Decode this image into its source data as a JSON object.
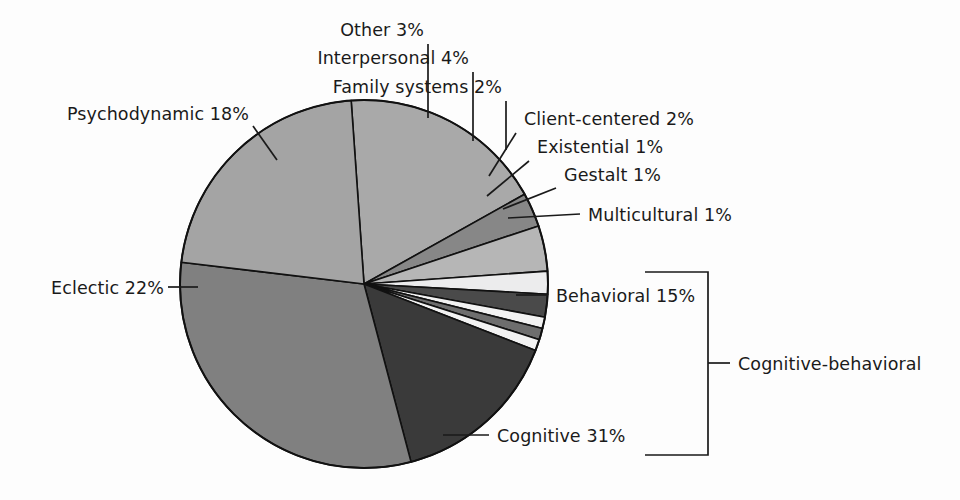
{
  "chart_data": {
    "type": "pie",
    "title": "",
    "subtitle": "",
    "xlabel": "",
    "ylabel": "",
    "legend_position": "callout-labels",
    "grid": false,
    "units": "percent",
    "total": 100,
    "start_angle_deg": -94,
    "direction": "clockwise",
    "categories": [
      "Psychodynamic",
      "Other",
      "Interpersonal",
      "Family systems",
      "Client-centered",
      "Existential",
      "Gestalt",
      "Multicultural",
      "Behavioral",
      "Cognitive",
      "Eclectic"
    ],
    "values": [
      18,
      3,
      4,
      2,
      2,
      1,
      1,
      1,
      15,
      31,
      22
    ],
    "colors": [
      "#a9a9a9",
      "#878787",
      "#b6b6b6",
      "#ececed",
      "#4a4a4a",
      "#f2f2f2",
      "#6e6e6e",
      "#f2f2f2",
      "#3a3a3a",
      "#808080",
      "#a4a4a4"
    ],
    "slices": [
      {
        "label": "Psychodynamic",
        "value": 18,
        "display": "Psychodynamic 18%",
        "color": "#a9a9a9"
      },
      {
        "label": "Other",
        "value": 3,
        "display": "Other 3%",
        "color": "#878787"
      },
      {
        "label": "Interpersonal",
        "value": 4,
        "display": "Interpersonal 4%",
        "color": "#b6b6b6"
      },
      {
        "label": "Family systems",
        "value": 2,
        "display": "Family systems  2%",
        "color": "#ececed"
      },
      {
        "label": "Client-centered",
        "value": 2,
        "display": "Client-centered 2%",
        "color": "#4a4a4a"
      },
      {
        "label": "Existential",
        "value": 1,
        "display": "Existential 1%",
        "color": "#f2f2f2"
      },
      {
        "label": "Gestalt",
        "value": 1,
        "display": "Gestalt 1%",
        "color": "#6e6e6e"
      },
      {
        "label": "Multicultural",
        "value": 1,
        "display": "Multicultural 1%",
        "color": "#f2f2f2"
      },
      {
        "label": "Behavioral",
        "value": 15,
        "display": "Behavioral 15%",
        "color": "#3a3a3a"
      },
      {
        "label": "Cognitive",
        "value": 31,
        "display": "Cognitive 31%",
        "color": "#808080"
      },
      {
        "label": "Eclectic",
        "value": 22,
        "display": "Eclectic 22%",
        "color": "#a4a4a4"
      }
    ],
    "annotations": [
      {
        "text": "Cognitive-behavioral",
        "type": "bracket-group",
        "groups": [
          "Behavioral",
          "Cognitive"
        ],
        "group_total": 46
      }
    ]
  },
  "labels": {
    "other": "Other 3%",
    "interpersonal": "Interpersonal 4%",
    "family_systems": "Family systems  2%",
    "client_centered": "Client-centered 2%",
    "existential": "Existential 1%",
    "gestalt": "Gestalt 1%",
    "multicultural": "Multicultural 1%",
    "psychodynamic": "Psychodynamic 18%",
    "eclectic": "Eclectic 22%",
    "behavioral": "Behavioral 15%",
    "cognitive": "Cognitive 31%",
    "cognitive_behavioral": "Cognitive-behavioral"
  },
  "geometry": {
    "cx": 364,
    "cy": 284,
    "r": 184
  },
  "colors": {
    "background": "#fdfdfd",
    "text": "#1a1a1a",
    "stroke": "#111111"
  }
}
